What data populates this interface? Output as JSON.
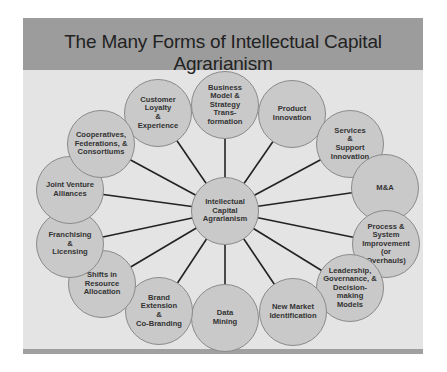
{
  "title": "The Many Forms of Intellectual Capital Agrarianism",
  "colors": {
    "header": "#9c9c9c",
    "panel": "#e4e4e4",
    "node_fill": "#c9c9c9",
    "node_stroke": "#8a8a8a",
    "connector": "#222222"
  },
  "center": {
    "label": "Intellectual\nCapital\nAgrarianism",
    "x": 225,
    "y": 211
  },
  "nodes": [
    {
      "label": "Customer\nLoyalty\n&\nExperience",
      "x": 158,
      "y": 113
    },
    {
      "label": "Business\nModel &\nStrategy\nTrans-\nformation",
      "x": 225,
      "y": 105
    },
    {
      "label": "Product\nInnovation",
      "x": 292,
      "y": 114
    },
    {
      "label": "Services\n&\nSupport\nInnovation",
      "x": 350,
      "y": 144
    },
    {
      "label": "M&A",
      "x": 385,
      "y": 188
    },
    {
      "label": "Process &\nSystem\nImprovement\n(or\nOverhauls)",
      "x": 386,
      "y": 244
    },
    {
      "label": "Leadership,\nGovernance, &\nDecision-making\nModels",
      "x": 350,
      "y": 288
    },
    {
      "label": "New Market\nIdentification",
      "x": 293,
      "y": 312
    },
    {
      "label": "Data\nMining",
      "x": 225,
      "y": 318
    },
    {
      "label": "Brand Extension\n&\nCo-Branding",
      "x": 159,
      "y": 311
    },
    {
      "label": "Shifts in\nResource\nAllocation",
      "x": 102,
      "y": 284
    },
    {
      "label": "Franchising\n&\nLicensing",
      "x": 70,
      "y": 244
    },
    {
      "label": "Joint Venture\nAlliances",
      "x": 70,
      "y": 190
    },
    {
      "label": "Cooperatives,\nFederations, &\nConsortiums",
      "x": 101,
      "y": 144
    }
  ]
}
